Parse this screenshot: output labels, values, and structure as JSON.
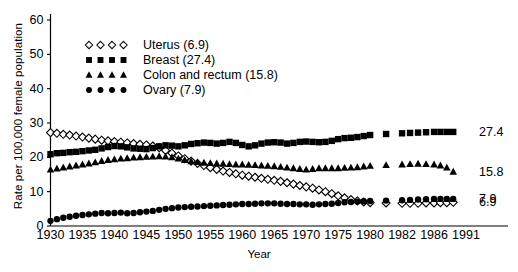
{
  "chart_data": {
    "type": "line",
    "title": "",
    "xlabel": "Year",
    "ylabel": "Rate per 100,000 female population",
    "ylim": [
      0,
      60
    ],
    "yticks": [
      0,
      10,
      20,
      30,
      40,
      50,
      60
    ],
    "grid": false,
    "legend_position": "upper-center-left",
    "xtick_labels": [
      "1930",
      "1935",
      "1940",
      "1945",
      "1950",
      "1955",
      "1960",
      "1965",
      "1970",
      "1975",
      "1980",
      "1982",
      "1986",
      "1991"
    ],
    "xtick_years": [
      1930,
      1935,
      1940,
      1945,
      1950,
      1955,
      1960,
      1965,
      1970,
      1975,
      1980,
      1982,
      1986,
      1991
    ],
    "x": [
      1930,
      1931,
      1932,
      1933,
      1934,
      1935,
      1936,
      1937,
      1938,
      1939,
      1940,
      1941,
      1942,
      1943,
      1944,
      1945,
      1946,
      1947,
      1948,
      1949,
      1950,
      1951,
      1952,
      1953,
      1954,
      1955,
      1956,
      1957,
      1958,
      1959,
      1960,
      1961,
      1962,
      1963,
      1964,
      1965,
      1966,
      1967,
      1968,
      1969,
      1970,
      1971,
      1972,
      1973,
      1974,
      1975,
      1976,
      1977,
      1978,
      1979,
      1980,
      1981,
      1982,
      1983,
      1984,
      1985,
      1986,
      1987,
      1988,
      1989
    ],
    "series": [
      {
        "name": "Uterus",
        "end_value": 6.9,
        "legend_label": "Uterus (6.9)",
        "marker": "open-diamond",
        "color": "#000000",
        "values": [
          27.2,
          27.0,
          26.7,
          26.5,
          26.2,
          25.9,
          25.6,
          25.3,
          25.0,
          24.8,
          24.6,
          24.4,
          24.2,
          24.0,
          23.8,
          23.6,
          23.3,
          22.8,
          22.0,
          21.2,
          20.4,
          19.6,
          18.9,
          18.2,
          17.6,
          17.0,
          16.5,
          16.0,
          15.6,
          15.2,
          14.8,
          14.5,
          14.2,
          13.9,
          13.6,
          13.3,
          13.0,
          12.6,
          12.2,
          11.8,
          11.4,
          11.0,
          10.5,
          10.0,
          9.4,
          8.8,
          8.2,
          7.7,
          7.3,
          7.0,
          6.8,
          6.7,
          6.6,
          6.6,
          6.6,
          6.7,
          6.7,
          6.8,
          6.8,
          6.9
        ]
      },
      {
        "name": "Breast",
        "end_value": 27.4,
        "legend_label": "Breast (27.4)",
        "marker": "filled-square",
        "color": "#000000",
        "values": [
          20.9,
          21.2,
          21.3,
          21.5,
          21.6,
          21.8,
          22.0,
          22.2,
          22.6,
          23.0,
          23.3,
          23.2,
          22.9,
          22.6,
          22.5,
          22.4,
          22.7,
          23.2,
          23.5,
          23.4,
          23.2,
          23.5,
          23.9,
          24.1,
          24.3,
          24.2,
          24.0,
          24.2,
          24.5,
          24.2,
          23.6,
          23.2,
          23.5,
          24.0,
          24.3,
          24.4,
          24.3,
          24.0,
          24.2,
          24.5,
          24.6,
          24.5,
          24.4,
          24.5,
          24.8,
          25.3,
          25.6,
          25.7,
          25.9,
          26.2,
          26.5,
          26.8,
          27.0,
          27.1,
          27.2,
          27.3,
          27.4,
          27.4,
          27.4,
          27.4
        ]
      },
      {
        "name": "Colon and rectum",
        "end_value": 15.8,
        "legend_label": "Colon and rectum (15.8)",
        "marker": "filled-triangle",
        "color": "#000000",
        "values": [
          16.4,
          16.7,
          17.0,
          17.3,
          17.6,
          17.9,
          18.2,
          18.5,
          18.9,
          19.2,
          19.4,
          19.6,
          19.7,
          19.9,
          20.0,
          20.1,
          20.2,
          20.3,
          20.2,
          20.0,
          19.6,
          19.2,
          18.8,
          18.6,
          18.4,
          18.3,
          18.2,
          18.1,
          18.0,
          17.9,
          17.9,
          17.8,
          17.7,
          17.6,
          17.5,
          17.4,
          17.2,
          17.0,
          16.8,
          16.6,
          16.4,
          16.6,
          16.8,
          16.8,
          16.8,
          16.8,
          16.9,
          17.0,
          17.1,
          17.3,
          17.5,
          17.7,
          17.9,
          18.0,
          18.1,
          18.0,
          17.9,
          17.6,
          17.0,
          15.8
        ]
      },
      {
        "name": "Ovary",
        "end_value": 7.9,
        "legend_label": "Ovary (7.9)",
        "marker": "filled-circle",
        "color": "#000000",
        "values": [
          1.5,
          2.0,
          2.4,
          2.7,
          3.0,
          3.2,
          3.4,
          3.6,
          3.8,
          3.7,
          3.8,
          3.9,
          3.7,
          3.8,
          4.0,
          4.2,
          4.4,
          4.7,
          5.0,
          5.2,
          5.4,
          5.5,
          5.6,
          5.7,
          5.8,
          5.9,
          6.0,
          6.1,
          6.2,
          6.3,
          6.4,
          6.4,
          6.5,
          6.6,
          6.6,
          6.6,
          6.5,
          6.4,
          6.4,
          6.3,
          6.3,
          6.2,
          6.3,
          6.4,
          6.5,
          6.7,
          6.9,
          7.0,
          7.1,
          7.2,
          7.3,
          7.4,
          7.5,
          7.6,
          7.7,
          7.8,
          7.9,
          7.9,
          7.9,
          7.9
        ]
      }
    ],
    "end_labels": [
      {
        "value": "27.4",
        "series": "Breast"
      },
      {
        "value": "15.8",
        "series": "Colon and rectum"
      },
      {
        "value": "7.9",
        "series": "Ovary"
      },
      {
        "value": "6.9",
        "series": "Uterus"
      }
    ]
  }
}
